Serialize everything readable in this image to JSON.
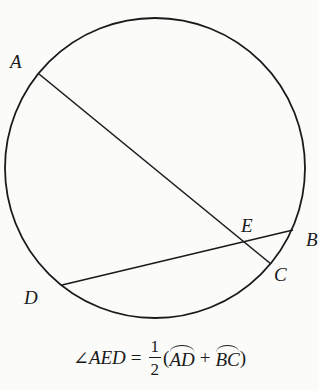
{
  "diagram": {
    "type": "circle-with-intersecting-chords",
    "stroke_color": "#1a1a1a",
    "background_color": "#fbfbfa",
    "circle": {
      "cx": 155,
      "cy": 168,
      "r": 150
    },
    "points": {
      "A": {
        "label": "A",
        "x": 39,
        "y": 74,
        "label_x": 10,
        "label_y": 68
      },
      "B": {
        "label": "B",
        "x": 293,
        "y": 230,
        "label_x": 306,
        "label_y": 246
      },
      "C": {
        "label": "C",
        "x": 271,
        "y": 264,
        "label_x": 274,
        "label_y": 281
      },
      "D": {
        "label": "D",
        "x": 62,
        "y": 285,
        "label_x": 24,
        "label_y": 304
      },
      "E": {
        "label": "E",
        "x": 244,
        "y": 242,
        "label_x": 241,
        "label_y": 232
      }
    },
    "chords": [
      {
        "name": "AC",
        "from": "A",
        "to": "C"
      },
      {
        "name": "DB",
        "from": "D",
        "to": "B"
      }
    ]
  },
  "formula": {
    "angle_symbol": "∠",
    "angle_name": "AED",
    "equals": "=",
    "fraction_numerator": "1",
    "fraction_denominator": "2",
    "open_paren": "(",
    "arc1": "AD",
    "plus": "+",
    "arc2": "BC",
    "close_paren": ")",
    "full_text": "∠AED = 1/2 (arc AD + arc BC)"
  }
}
